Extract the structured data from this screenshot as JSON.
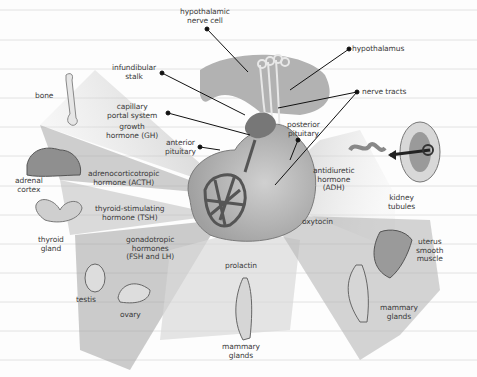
{
  "diagram": {
    "structure_labels": {
      "hypothalamic_nerve_cell": "hypothalamic\nnerve cell",
      "hypothalamus": "hypothalamus",
      "infundibular_stalk": "infundibular\nstalk",
      "nerve_tracts": "nerve tracts",
      "capillary_portal_system": "capillary\nportal system",
      "anterior_pituitary": "anterior\npituitary",
      "posterior_pituitary": "posterior\npituitary"
    },
    "hormones": {
      "gh": "growth\nhormone (GH)",
      "acth": "adrenocorticotropic\nhormone (ACTH)",
      "tsh": "thyroid-stimulating\nhormone (TSH)",
      "gonadotropic": "gonadotropic\nhormones\n(FSH and LH)",
      "prolactin": "prolactin",
      "adh": "antidiuretic\nhormone\n(ADH)",
      "oxytocin": "oxytocin"
    },
    "targets": {
      "bone": "bone",
      "adrenal_cortex": "adrenal\ncortex",
      "thyroid_gland": "thyroid\ngland",
      "testis": "testis",
      "ovary": "ovary",
      "mammary_glands_prolactin": "mammary\nglands",
      "kidney_tubules": "kidney\ntubules",
      "uterus_smooth_muscle": "uterus\nsmooth\nmuscle",
      "mammary_glands_oxytocin": "mammary\nglands"
    },
    "colors": {
      "gland": "#a9a9a9",
      "capillary": "#5a5a5a",
      "beam_dark": "#9a9a9a",
      "beam_light": "#d9d9d9",
      "ruled_line": "#e2e2e2",
      "label_text": "#3a3a3a"
    }
  }
}
